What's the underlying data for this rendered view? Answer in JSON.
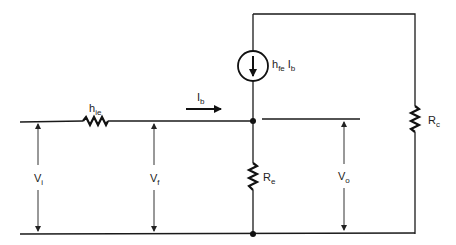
{
  "diagram": {
    "type": "small-signal equivalent circuit",
    "components": {
      "input_resistance": {
        "symbol": "h",
        "subscript": "ie"
      },
      "current_source": {
        "symbol": "h",
        "subscript": "fe",
        "symbol2": "I",
        "subscript2": "b"
      },
      "emitter_resistor": {
        "symbol": "R",
        "subscript": "e"
      },
      "collector_resistor": {
        "symbol": "R",
        "subscript": "c"
      }
    },
    "current": {
      "symbol": "I",
      "subscript": "b",
      "direction": "right"
    },
    "voltages": {
      "input": {
        "symbol": "V",
        "subscript": "i"
      },
      "feedback": {
        "symbol": "V",
        "subscript": "f"
      },
      "output": {
        "symbol": "V",
        "subscript": "o"
      }
    },
    "colors": {
      "line": "#1a1a1a",
      "background": "#ffffff"
    }
  }
}
